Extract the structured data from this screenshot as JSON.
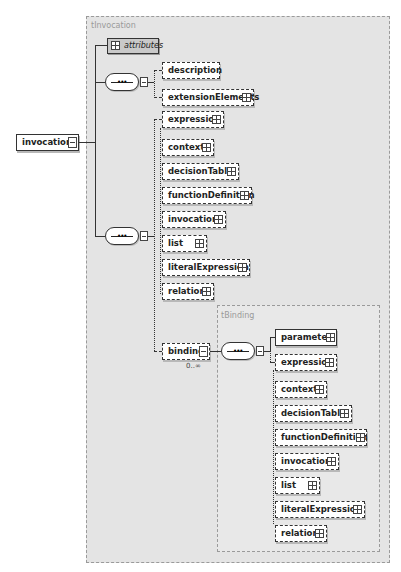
{
  "diagram": {
    "root_element": "invocation",
    "outer_type": {
      "label": "tInvocation",
      "attributes_label": "attributes",
      "sequence1": {
        "children": [
          {
            "name": "description",
            "optional": true,
            "expandable": false
          },
          {
            "name": "extensionElements",
            "optional": true,
            "expandable": true
          }
        ]
      },
      "sequence2": {
        "choice": [
          {
            "name": "expression",
            "optional": true,
            "expandable": true
          },
          {
            "name": "context",
            "optional": true,
            "expandable": true
          },
          {
            "name": "decisionTable",
            "optional": true,
            "expandable": true
          },
          {
            "name": "functionDefinition",
            "optional": true,
            "expandable": true
          },
          {
            "name": "invocation",
            "optional": true,
            "expandable": true
          },
          {
            "name": "list",
            "optional": true,
            "expandable": true
          },
          {
            "name": "literalExpression",
            "optional": true,
            "expandable": true
          },
          {
            "name": "relation",
            "optional": true,
            "expandable": true
          }
        ],
        "binding": {
          "name": "binding",
          "cardinality": "0..∞",
          "type_label": "tBinding",
          "children": [
            {
              "name": "parameter",
              "optional": false,
              "expandable": true
            },
            {
              "name": "expression",
              "optional": true,
              "expandable": true
            },
            {
              "name": "context",
              "optional": true,
              "expandable": true
            },
            {
              "name": "decisionTable",
              "optional": true,
              "expandable": true
            },
            {
              "name": "functionDefinition",
              "optional": true,
              "expandable": true
            },
            {
              "name": "invocation",
              "optional": true,
              "expandable": true
            },
            {
              "name": "list",
              "optional": true,
              "expandable": true
            },
            {
              "name": "literalExpression",
              "optional": true,
              "expandable": true
            },
            {
              "name": "relation",
              "optional": true,
              "expandable": true
            }
          ]
        }
      }
    },
    "colors": {
      "type_box_bg": "#e4e4e4",
      "attributes_bg": "#c9c9c9",
      "element_bg": "#ffffff",
      "line": "#333333"
    }
  }
}
